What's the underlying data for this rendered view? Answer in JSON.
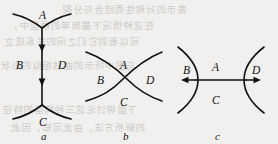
{
  "figure": {
    "background_color": "#f1f0ee",
    "ink_color": "#111111",
    "bleed_color": "#b9b5b0",
    "width": 278,
    "height": 144,
    "panels": [
      {
        "id": "a",
        "caption": "a",
        "kind": "vertex-pair-with-arrows",
        "labels": {
          "top": "A",
          "left": "B",
          "right": "D",
          "bottom": "C"
        },
        "arrow_count": 2,
        "arrow_direction": "down"
      },
      {
        "id": "b",
        "caption": "b",
        "kind": "crossing-curves",
        "labels": {
          "top": "A",
          "left": "B",
          "right": "D",
          "bottom": "C"
        },
        "arrow_count": 0,
        "arrow_direction": "none"
      },
      {
        "id": "c",
        "caption": "c",
        "kind": "opposed-curves-with-arrows",
        "labels": {
          "top": "A",
          "left": "B",
          "right": "D",
          "bottom": "C"
        },
        "arrow_count": 2,
        "arrow_direction": "outward-horizontal"
      }
    ]
  },
  "bleed_text": {
    "lines": [
      "表示的对称性而结合与分裂",
      "在这种情况下最简单的模型中，",
      "可以看到它们之间的关系成立",
      "与图中所示的曲线相似的形状",
      "下面将讨论这三种构型的特征",
      "的解析方法。由此可知，因此"
    ]
  }
}
